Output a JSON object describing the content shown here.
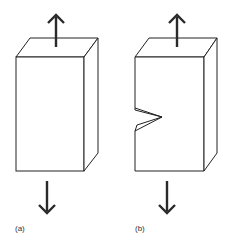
{
  "figure": {
    "panels": [
      {
        "id": "a",
        "label": "(a)",
        "description": "rectangular block under tension, no notch"
      },
      {
        "id": "b",
        "label": "(b)",
        "description": "rectangular block under tension with V-notch on left face"
      }
    ],
    "colors": {
      "stroke": "#222222",
      "arrow": "#2a2a2a",
      "background": "#ffffff"
    }
  }
}
